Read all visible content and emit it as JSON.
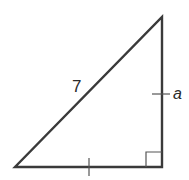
{
  "figure": {
    "type": "right-triangle",
    "vertices": {
      "bottom_left": [
        15,
        167
      ],
      "bottom_right": [
        162,
        167
      ],
      "top": [
        162,
        17
      ]
    },
    "hypotenuse_label": "7",
    "vertical_leg_label": "a",
    "right_angle_marker": true,
    "congruence_ticks": [
      "vertical-leg",
      "horizontal-leg"
    ],
    "colors": {
      "stroke": "#3a3a3a",
      "background": "#ffffff"
    }
  }
}
